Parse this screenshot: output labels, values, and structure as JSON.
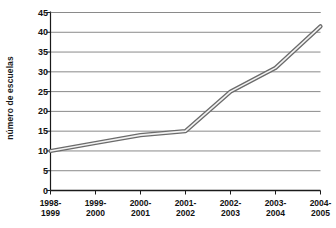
{
  "chart_data": {
    "type": "line",
    "title": "",
    "xlabel": "",
    "ylabel": "número de escuelas",
    "ylim": [
      0,
      45
    ],
    "ytick_step": 5,
    "yticks": [
      "0",
      "5",
      "10",
      "15",
      "20",
      "25",
      "30",
      "35",
      "40",
      "45"
    ],
    "grid": "horizontal",
    "legend": "none",
    "categories": [
      "1998-1999",
      "1999-2000",
      "2000-2001",
      "2001-2002",
      "2002-2003",
      "2003-2004",
      "2004-2005"
    ],
    "category_lines": [
      [
        "1998-",
        "1999"
      ],
      [
        "1999-",
        "2000"
      ],
      [
        "2000-",
        "2001"
      ],
      [
        "2001-",
        "2002"
      ],
      [
        "2002-",
        "2003"
      ],
      [
        "2003-",
        "2004"
      ],
      [
        "2004-",
        "2005"
      ]
    ],
    "series": [
      {
        "name": "número de escuelas",
        "values": [
          10,
          12,
          14,
          15,
          25,
          31,
          41.5
        ]
      }
    ],
    "colors": {
      "line": "#6b6b6b",
      "line_fill": "#f2f2f2",
      "grid": "#8a8a8a",
      "axis": "#1a1a1a",
      "background": "#ffffff",
      "text": "#111111"
    }
  }
}
